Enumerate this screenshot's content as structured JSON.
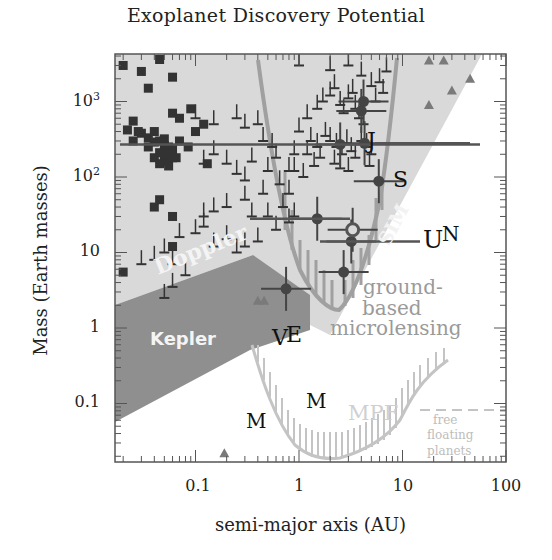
{
  "chart_data": {
    "type": "scatter",
    "title": "Exoplanet Discovery Potential",
    "xlabel": "semi-major axis (AU)",
    "ylabel": "Mass (Earth masses)",
    "xscale": "log",
    "yscale": "log",
    "xlim": [
      0.0166,
      100
    ],
    "ylim": [
      0.017,
      4000
    ],
    "x_ticks": [
      {
        "value": 0.1,
        "label": "0.1"
      },
      {
        "value": 1,
        "label": "1"
      },
      {
        "value": 10,
        "label": "10"
      },
      {
        "value": 100,
        "label": "100"
      }
    ],
    "y_ticks": [
      {
        "value": 0.1,
        "label": "0.1"
      },
      {
        "value": 1,
        "label": "1"
      },
      {
        "value": 10,
        "label": "10"
      },
      {
        "value": 100,
        "label": "10",
        "sup": "2"
      },
      {
        "value": 1000,
        "label": "10",
        "sup": "3"
      }
    ],
    "grid": false,
    "regions": [
      {
        "name": "Doppler",
        "label": "Doppler",
        "color": "#d9d9d9",
        "description": "light grey sensitivity region, upper-left to upper-right diagonal"
      },
      {
        "name": "SIM",
        "label": "SIM",
        "color": "#d9d9d9",
        "description": "astrometry region extending diagonally to upper right"
      },
      {
        "name": "Kepler",
        "label": "Kepler",
        "color": "#8f8f8f",
        "description": "dark grey transit region lower-left"
      },
      {
        "name": "ground-based microlensing",
        "label": "ground-based microlensing",
        "color": "#a0a0a0",
        "description": "V-shaped hatched curve around 2-3 AU"
      },
      {
        "name": "MPF",
        "label": "MPF",
        "color": "#c4c4c4",
        "description": "space microlensing U-shaped hatched curve"
      },
      {
        "name": "free floating planets",
        "label": "free floating planets",
        "color": "#c4c4c4",
        "description": "dashed horizontal line at ~0.2 Earth masses beyond ~20 AU"
      }
    ],
    "solar_system_labels": [
      {
        "label": "V",
        "a": 0.72,
        "m": 0.82
      },
      {
        "label": "E",
        "a": 1.0,
        "m": 1.0
      },
      {
        "label": "M",
        "a": 0.2,
        "m": 0.05
      },
      {
        "label": "M",
        "a": 0.95,
        "m": 0.09
      },
      {
        "label": "J",
        "a": 5.2,
        "m": 318
      },
      {
        "label": "S",
        "a": 9.5,
        "m": 95
      },
      {
        "label": "U",
        "a": 19,
        "m": 14.5
      },
      {
        "label": "N",
        "a": 30,
        "m": 17
      }
    ],
    "series": [
      {
        "name": "Transit planets (squares)",
        "marker": "square",
        "color": "#333333",
        "points": [
          [
            0.02,
            3000
          ],
          [
            0.03,
            2500
          ],
          [
            0.045,
            3600
          ],
          [
            0.06,
            2100
          ],
          [
            0.035,
            1500
          ],
          [
            0.06,
            700
          ],
          [
            0.025,
            550
          ],
          [
            0.03,
            380
          ],
          [
            0.035,
            330
          ],
          [
            0.04,
            400
          ],
          [
            0.04,
            290
          ],
          [
            0.045,
            300
          ],
          [
            0.05,
            320
          ],
          [
            0.05,
            260
          ],
          [
            0.045,
            210
          ],
          [
            0.055,
            250
          ],
          [
            0.04,
            180
          ],
          [
            0.045,
            150
          ],
          [
            0.05,
            160
          ],
          [
            0.06,
            180
          ],
          [
            0.055,
            140
          ],
          [
            0.06,
            230
          ],
          [
            0.07,
            300
          ],
          [
            0.07,
            600
          ],
          [
            0.065,
            180
          ],
          [
            0.05,
            200
          ],
          [
            0.035,
            250
          ],
          [
            0.028,
            400
          ],
          [
            0.022,
            420
          ],
          [
            0.025,
            300
          ],
          [
            0.09,
            800
          ],
          [
            0.1,
            400
          ],
          [
            0.085,
            250
          ],
          [
            0.12,
            500
          ],
          [
            0.13,
            150
          ],
          [
            0.04,
            40
          ],
          [
            0.06,
            30
          ],
          [
            0.06,
            12
          ],
          [
            0.02,
            5.5
          ],
          [
            0.045,
            50
          ]
        ]
      },
      {
        "name": "Doppler minimum masses (T-bars)",
        "marker": "tbar",
        "color": "#333333",
        "points": [
          [
            0.1,
            600
          ],
          [
            0.15,
            500
          ],
          [
            0.25,
            600
          ],
          [
            0.3,
            450
          ],
          [
            0.4,
            500
          ],
          [
            0.12,
            150
          ],
          [
            0.15,
            200
          ],
          [
            0.2,
            150
          ],
          [
            0.25,
            110
          ],
          [
            0.3,
            90
          ],
          [
            0.35,
            160
          ],
          [
            0.45,
            300
          ],
          [
            0.55,
            250
          ],
          [
            0.6,
            180
          ],
          [
            0.5,
            120
          ],
          [
            0.8,
            120
          ],
          [
            0.8,
            60
          ],
          [
            0.9,
            200
          ],
          [
            0.65,
            80
          ],
          [
            0.45,
            60
          ],
          [
            0.3,
            50
          ],
          [
            0.2,
            40
          ],
          [
            0.15,
            35
          ],
          [
            0.12,
            22
          ],
          [
            0.1,
            18
          ],
          [
            0.15,
            12
          ],
          [
            0.2,
            15
          ],
          [
            0.25,
            10
          ],
          [
            0.3,
            12
          ],
          [
            0.35,
            30
          ],
          [
            0.5,
            30
          ],
          [
            0.4,
            14
          ],
          [
            0.6,
            20
          ],
          [
            0.7,
            40
          ],
          [
            0.8,
            25
          ],
          [
            0.9,
            30
          ],
          [
            0.07,
            16
          ],
          [
            0.05,
            10
          ],
          [
            0.04,
            8
          ],
          [
            0.06,
            7
          ],
          [
            0.08,
            5
          ],
          [
            0.06,
            3.5
          ],
          [
            0.05,
            2.5
          ],
          [
            0.03,
            7
          ],
          [
            0.12,
            30
          ],
          [
            1.0,
            400
          ],
          [
            1.2,
            600
          ],
          [
            1.5,
            800
          ],
          [
            1.7,
            1000
          ],
          [
            2.0,
            1200
          ],
          [
            2.2,
            1500
          ],
          [
            2.5,
            900
          ],
          [
            2.7,
            700
          ],
          [
            3.0,
            1100
          ],
          [
            3.3,
            1300
          ],
          [
            3.5,
            800
          ],
          [
            3.8,
            600
          ],
          [
            4.2,
            500
          ],
          [
            1.3,
            300
          ],
          [
            1.5,
            250
          ],
          [
            1.8,
            350
          ],
          [
            2.0,
            300
          ],
          [
            2.3,
            250
          ],
          [
            2.6,
            200
          ],
          [
            2.9,
            280
          ],
          [
            3.2,
            220
          ],
          [
            3.5,
            180
          ],
          [
            4.0,
            300
          ],
          [
            4.5,
            250
          ],
          [
            5.0,
            200
          ],
          [
            1.2,
            200
          ],
          [
            1.6,
            180
          ],
          [
            2.2,
            150
          ],
          [
            1.4,
            140
          ],
          [
            0.9,
            120
          ],
          [
            1.1,
            100
          ],
          [
            2.5,
            130
          ],
          [
            3.0,
            120
          ],
          [
            4.8,
            140
          ],
          [
            6.0,
            1800
          ],
          [
            7.0,
            2500
          ],
          [
            2.0,
            2600
          ],
          [
            1.0,
            3000
          ],
          [
            3.0,
            3000
          ],
          [
            4.0,
            2200
          ],
          [
            5.0,
            1600
          ],
          [
            5.5,
            1000
          ],
          [
            6.5,
            1300
          ]
        ]
      },
      {
        "name": "Microlensing detections (circles with error bars)",
        "marker": "circle",
        "color": "#444444",
        "points": [
          [
            4.2,
            1000
          ],
          [
            4.0,
            750
          ],
          [
            2.5,
            270
          ],
          [
            4.3,
            280
          ],
          [
            5.9,
            88
          ],
          [
            1.5,
            28
          ],
          [
            3.3,
            20
          ],
          [
            3.2,
            14
          ],
          [
            2.7,
            5.5
          ],
          [
            0.75,
            3.3
          ]
        ]
      },
      {
        "name": "Imaging/other (triangles)",
        "marker": "triangle",
        "color": "#7a7a7a",
        "points": [
          [
            18,
            3500
          ],
          [
            25,
            3500
          ],
          [
            45,
            2000
          ],
          [
            30,
            1400
          ],
          [
            18,
            900
          ],
          [
            0.19,
            0.022
          ],
          [
            0.4,
            2.3
          ],
          [
            0.46,
            2.3
          ]
        ]
      }
    ]
  },
  "labels": {
    "title": "Exoplanet Discovery Potential",
    "xlabel": "semi-major axis (AU)",
    "ylabel": "Mass (Earth masses)",
    "doppler": "Doppler",
    "sim": "SIM",
    "kepler": "Kepler",
    "ground1": "ground-",
    "ground2": "based",
    "ground3": "microlensing",
    "mpf": "MPF",
    "free1": "free",
    "free2": "floating",
    "free3": "planets",
    "planet_V": "V",
    "planet_E": "E",
    "planet_M": "M",
    "planet_J": "J",
    "planet_S": "S",
    "planet_U": "U",
    "planet_N": "N",
    "xtick_01": "0.1",
    "xtick_1": "1",
    "xtick_10": "10",
    "xtick_100": "100",
    "ytick_01": "0.1",
    "ytick_1": "1",
    "ytick_10": "10",
    "ytick_100_base": "10",
    "ytick_100_sup": "2",
    "ytick_1000_base": "10",
    "ytick_1000_sup": "3"
  },
  "colors": {
    "light_region": "#d9d9d9",
    "dark_region": "#8f8f8f",
    "microlensing_curve": "#9a9a9a",
    "mpf_curve": "#c8c8c8",
    "markers": "#333333",
    "axis": "#555555"
  }
}
